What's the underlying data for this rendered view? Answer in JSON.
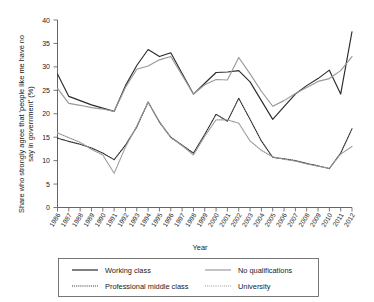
{
  "chart_data": {
    "type": "line",
    "title": "",
    "xlabel": "Year",
    "ylabel": "Share who strongly agree that 'people like me have no say in government' (%)",
    "x": [
      1986,
      1987,
      1988,
      1989,
      1990,
      1991,
      1992,
      1993,
      1994,
      1995,
      1996,
      1997,
      1998,
      1999,
      2000,
      2001,
      2002,
      2003,
      2004,
      2005,
      2006,
      2007,
      2008,
      2009,
      2010,
      2011,
      2012
    ],
    "xtick_labels": [
      "1986",
      "1987",
      "1988",
      "1989",
      "1990",
      "1991",
      "1992",
      "1993",
      "1994",
      "1995",
      "1996",
      "1997",
      "1998",
      "1999",
      "2000",
      "2001",
      "2002",
      "2003",
      "2004",
      "2005",
      "2006",
      "2007",
      "2008",
      "2009",
      "2010",
      "2011",
      "2012"
    ],
    "ytick_labels": [
      "0",
      "5",
      "10",
      "15",
      "20",
      "25",
      "30",
      "35",
      "40"
    ],
    "yticks": [
      0,
      5,
      10,
      15,
      20,
      25,
      30,
      35,
      40
    ],
    "ylim": [
      0,
      40
    ],
    "xlim": [
      1986,
      2012
    ],
    "grid": false,
    "legend_position": "bottom",
    "series": [
      {
        "name": "Working class",
        "style": "solid",
        "color": "#2b2b2b",
        "values": [
          28.5,
          23.7,
          22.8,
          21.9,
          21.2,
          20.5,
          26.0,
          30.3,
          33.7,
          32.2,
          33.0,
          28.6,
          24.2,
          26.5,
          28.8,
          28.9,
          29.2,
          26.8,
          22.8,
          18.8,
          21.5,
          24.2,
          26.0,
          27.5,
          29.3,
          24.2,
          37.5
        ]
      },
      {
        "name": "No qualifications",
        "style": "solid",
        "color": "#999999",
        "values": [
          25.4,
          22.2,
          21.8,
          21.3,
          21.0,
          20.5,
          25.6,
          29.5,
          30.2,
          31.5,
          32.2,
          28.2,
          24.2,
          26.2,
          27.3,
          27.2,
          32.0,
          28.5,
          24.8,
          21.6,
          22.8,
          24.3,
          25.6,
          26.9,
          27.5,
          29.2,
          32.2
        ]
      },
      {
        "name": "Professional middle class",
        "style": "dotted",
        "color": "#2b2b2b",
        "values": [
          14.8,
          14.1,
          13.5,
          12.7,
          11.6,
          10.2,
          13.3,
          17.2,
          22.5,
          18.2,
          15.0,
          13.3,
          11.6,
          15.6,
          19.9,
          18.4,
          23.3,
          18.8,
          14.2,
          10.7,
          10.4,
          10.0,
          9.4,
          8.9,
          8.3,
          11.6,
          16.8
        ]
      },
      {
        "name": "University",
        "style": "dotted",
        "color": "#999999",
        "values": [
          15.9,
          14.9,
          13.9,
          12.4,
          11.2,
          7.3,
          12.9,
          17.4,
          22.5,
          18.3,
          14.9,
          13.2,
          11.2,
          15.2,
          18.7,
          18.7,
          18.0,
          14.2,
          12.2,
          10.8,
          10.3,
          9.9,
          9.3,
          8.8,
          8.4,
          11.4,
          13.0
        ]
      }
    ]
  },
  "legend": {
    "items": [
      {
        "label": "Working class",
        "style": "solid",
        "color": "#2b2b2b"
      },
      {
        "label": "No qualifications",
        "style": "solid",
        "color": "#999999"
      },
      {
        "label": "Professional middle class",
        "style": "dotted",
        "color": "#2b2b2b"
      },
      {
        "label": "University",
        "style": "dotted",
        "color": "#999999"
      }
    ]
  }
}
